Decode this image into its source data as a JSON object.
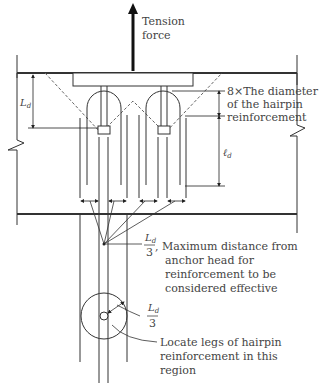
{
  "diagram": {
    "type": "anchor-hairpin-reinforcement",
    "labels": {
      "tension_line1": "Tension",
      "tension_line2": "force",
      "diam_line1": "8×The diameter",
      "diam_line2": "of the hairpin",
      "diam_line3": "reinforcement",
      "Ld_symbol": "L",
      "Ld_sub": "d",
      "ld_symbol": "ℓ",
      "ld_sub": "d",
      "frac_num": "L",
      "frac_sub": "d",
      "frac_den": "3",
      "maxdist_line1": ", Maximum distance from",
      "maxdist_line2": "anchor head for",
      "maxdist_line3": "reinforcement to be",
      "maxdist_line4": "considered effective",
      "frac2_num": "L",
      "frac2_sub": "d",
      "frac2_den": "3",
      "locate_line1": "Locate legs of hairpin",
      "locate_line2": "reinforcement in this",
      "locate_line3": "region"
    },
    "colors": {
      "line": "#333333",
      "text": "#444444",
      "dashed": "#666666"
    }
  }
}
